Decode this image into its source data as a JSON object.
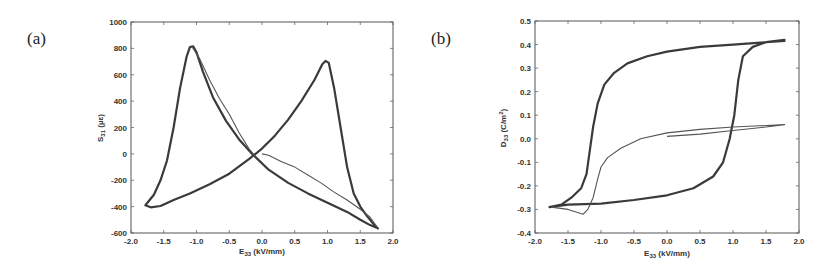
{
  "chart_data": [
    {
      "id": "a",
      "panel_label": "(a)",
      "type": "line",
      "title": "",
      "xlabel": "E33 (kV/mm)",
      "xlabel_main": "E",
      "xlabel_sub": "33",
      "xlabel_unit": " (kV/mm)",
      "ylabel": "S31 (µε)",
      "ylabel_main": "S",
      "ylabel_sub": "31",
      "ylabel_unit": " (µε)",
      "xlim": [
        -2.0,
        2.0
      ],
      "ylim": [
        -600,
        1000
      ],
      "xticks": [
        -2.0,
        -1.5,
        -1.0,
        -0.5,
        0.0,
        0.5,
        1.0,
        1.5,
        2.0
      ],
      "xtick_labels": [
        "-2.0",
        "-1.5",
        "-1.0",
        "-0.5",
        "0.0",
        "0.5",
        "1.0",
        "1.5",
        "2.0"
      ],
      "yticks": [
        -600,
        -400,
        -200,
        0,
        200,
        400,
        600,
        800,
        1000
      ],
      "ytick_labels": [
        "-600",
        "-400",
        "-200",
        "0",
        "200",
        "400",
        "600",
        "800",
        "1000"
      ],
      "grid": false,
      "legend": null,
      "frame_px": {
        "left": 131,
        "top": 22,
        "right": 393,
        "bottom": 233
      },
      "series": [
        {
          "name": "butterfly loop (cycled)",
          "style": "main",
          "points": [
            [
              1.75,
              -560
            ],
            [
              1.65,
              -540
            ],
            [
              1.5,
              -500
            ],
            [
              1.3,
              -440
            ],
            [
              1.0,
              -370
            ],
            [
              0.7,
              -300
            ],
            [
              0.4,
              -220
            ],
            [
              0.1,
              -120
            ],
            [
              -0.15,
              0
            ],
            [
              -0.35,
              110
            ],
            [
              -0.55,
              250
            ],
            [
              -0.75,
              430
            ],
            [
              -0.9,
              620
            ],
            [
              -1.0,
              770
            ],
            [
              -1.05,
              815
            ],
            [
              -1.1,
              810
            ],
            [
              -1.15,
              740
            ],
            [
              -1.25,
              500
            ],
            [
              -1.35,
              200
            ],
            [
              -1.45,
              -50
            ],
            [
              -1.55,
              -200
            ],
            [
              -1.65,
              -310
            ],
            [
              -1.78,
              -390
            ],
            [
              -1.7,
              -405
            ],
            [
              -1.55,
              -395
            ],
            [
              -1.35,
              -350
            ],
            [
              -1.1,
              -300
            ],
            [
              -0.8,
              -230
            ],
            [
              -0.5,
              -150
            ],
            [
              -0.2,
              -40
            ],
            [
              0.0,
              40
            ],
            [
              0.2,
              140
            ],
            [
              0.4,
              260
            ],
            [
              0.6,
              400
            ],
            [
              0.8,
              560
            ],
            [
              0.92,
              680
            ],
            [
              0.97,
              705
            ],
            [
              1.02,
              690
            ],
            [
              1.1,
              500
            ],
            [
              1.2,
              200
            ],
            [
              1.3,
              -100
            ],
            [
              1.4,
              -300
            ],
            [
              1.5,
              -400
            ],
            [
              1.6,
              -470
            ],
            [
              1.7,
              -530
            ],
            [
              1.77,
              -565
            ]
          ]
        },
        {
          "name": "initial loading curve",
          "style": "thin",
          "points": [
            [
              0.0,
              0
            ],
            [
              0.1,
              -10
            ],
            [
              0.3,
              -60
            ],
            [
              0.5,
              -100
            ],
            [
              0.7,
              -160
            ],
            [
              0.9,
              -220
            ],
            [
              1.1,
              -290
            ],
            [
              1.3,
              -350
            ],
            [
              1.5,
              -420
            ],
            [
              1.65,
              -480
            ],
            [
              1.75,
              -550
            ]
          ]
        },
        {
          "name": "first descent branch",
          "style": "thin",
          "points": [
            [
              -1.08,
              820
            ],
            [
              -0.95,
              720
            ],
            [
              -0.8,
              560
            ],
            [
              -0.65,
              420
            ],
            [
              -0.5,
              300
            ],
            [
              -0.35,
              160
            ],
            [
              -0.2,
              40
            ],
            [
              -0.1,
              -20
            ]
          ]
        }
      ]
    },
    {
      "id": "b",
      "panel_label": "(b)",
      "type": "line",
      "title": "",
      "xlabel": "E33 (kV/mm)",
      "xlabel_main": "E",
      "xlabel_sub": "33",
      "xlabel_unit": " (kV/mm)",
      "ylabel": "D33 (C/m²)",
      "ylabel_main": "D",
      "ylabel_sub": "33",
      "ylabel_unit": " (C/m",
      "ylabel_sup": "2",
      "ylabel_close": ")",
      "xlim": [
        -2.0,
        2.0
      ],
      "ylim": [
        -0.4,
        0.5
      ],
      "xticks": [
        -2.0,
        -1.5,
        -1.0,
        -0.5,
        0.0,
        0.5,
        1.0,
        1.5,
        2.0
      ],
      "xtick_labels": [
        "-2.0",
        "-1.5",
        "-1.0",
        "-0.5",
        "0.0",
        "0.5",
        "1.0",
        "1.5",
        "2.0"
      ],
      "yticks": [
        -0.4,
        -0.3,
        -0.2,
        -0.1,
        0.0,
        0.1,
        0.2,
        0.3,
        0.4,
        0.5
      ],
      "ytick_labels": [
        "-0.4",
        "-0.3",
        "-0.2",
        "-0.1",
        "0.0",
        "0.1",
        "0.2",
        "0.3",
        "0.4",
        "0.5"
      ],
      "grid": false,
      "legend": null,
      "frame_px": {
        "left": 535,
        "top": 21,
        "right": 799,
        "bottom": 233
      },
      "series": [
        {
          "name": "hysteresis loop (cycled)",
          "style": "main",
          "points": [
            [
              1.78,
              0.415
            ],
            [
              1.5,
              0.41
            ],
            [
              1.0,
              0.4
            ],
            [
              0.5,
              0.39
            ],
            [
              0.0,
              0.37
            ],
            [
              -0.3,
              0.35
            ],
            [
              -0.6,
              0.32
            ],
            [
              -0.8,
              0.28
            ],
            [
              -0.95,
              0.23
            ],
            [
              -1.05,
              0.15
            ],
            [
              -1.12,
              0.05
            ],
            [
              -1.17,
              -0.05
            ],
            [
              -1.22,
              -0.15
            ],
            [
              -1.3,
              -0.21
            ],
            [
              -1.45,
              -0.25
            ],
            [
              -1.6,
              -0.28
            ],
            [
              -1.78,
              -0.29
            ],
            [
              -1.5,
              -0.28
            ],
            [
              -1.0,
              -0.275
            ],
            [
              -0.5,
              -0.26
            ],
            [
              0.0,
              -0.24
            ],
            [
              0.4,
              -0.21
            ],
            [
              0.7,
              -0.16
            ],
            [
              0.85,
              -0.1
            ],
            [
              0.95,
              0.0
            ],
            [
              1.02,
              0.1
            ],
            [
              1.08,
              0.25
            ],
            [
              1.15,
              0.35
            ],
            [
              1.3,
              0.39
            ],
            [
              1.5,
              0.41
            ],
            [
              1.78,
              0.42
            ]
          ]
        },
        {
          "name": "initial loop",
          "style": "thin",
          "points": [
            [
              0.0,
              0.01
            ],
            [
              0.5,
              0.02
            ],
            [
              1.0,
              0.035
            ],
            [
              1.5,
              0.05
            ],
            [
              1.78,
              0.06
            ],
            [
              1.4,
              0.055
            ],
            [
              1.0,
              0.05
            ],
            [
              0.5,
              0.04
            ],
            [
              0.0,
              0.025
            ],
            [
              -0.4,
              0.0
            ],
            [
              -0.7,
              -0.04
            ],
            [
              -0.9,
              -0.08
            ],
            [
              -1.0,
              -0.12
            ],
            [
              -1.05,
              -0.17
            ],
            [
              -1.12,
              -0.25
            ],
            [
              -1.2,
              -0.3
            ],
            [
              -1.27,
              -0.32
            ],
            [
              -1.5,
              -0.3
            ],
            [
              -1.75,
              -0.29
            ]
          ]
        }
      ]
    }
  ]
}
